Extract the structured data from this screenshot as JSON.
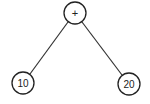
{
  "tree": {
    "root": {
      "label": "+"
    },
    "left": {
      "label": "10"
    },
    "right": {
      "label": "20"
    }
  },
  "colors": {
    "stroke": "#222222",
    "background": "#ffffff"
  }
}
